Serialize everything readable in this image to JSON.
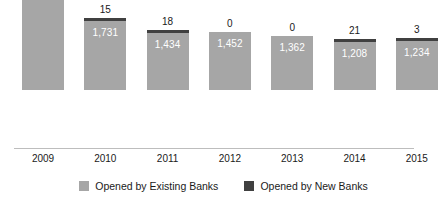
{
  "chart_data": {
    "type": "bar",
    "subtype": "stacked-bar",
    "title": "",
    "xlabel": "",
    "ylabel": "",
    "grid": false,
    "axis_visible": {
      "x": true,
      "y": false
    },
    "ylim": [
      0,
      3200
    ],
    "legend_position": "bottom-center",
    "categories": [
      "2009",
      "2010",
      "2011",
      "2012",
      "2013",
      "2014",
      "2015"
    ],
    "series": [
      {
        "name": "Opened by Existing Banks",
        "color": "#a6a6a6",
        "values": [
          2800,
          1731,
          1434,
          1452,
          1362,
          1208,
          1234
        ],
        "value_labels": [
          "2,800",
          "1,731",
          "1,434",
          "1,452",
          "1,362",
          "1,208",
          "1,234"
        ],
        "label_position": "inside-top"
      },
      {
        "name": "Opened by New Banks",
        "color": "#404040",
        "values": [
          81,
          15,
          18,
          0,
          0,
          21,
          3
        ],
        "value_labels": [
          "81",
          "15",
          "18",
          "0",
          "0",
          "21",
          "3"
        ],
        "label_position": "outside-top"
      }
    ]
  },
  "legend": {
    "items": [
      {
        "label": "Opened by Existing Banks",
        "color": "#a6a6a6"
      },
      {
        "label": "Opened by New Banks",
        "color": "#404040"
      }
    ]
  },
  "colors": {
    "existing": "#a6a6a6",
    "new": "#404040",
    "axis": "#bdbdbd",
    "text": "#1a1a1a",
    "inside_label_text": "#ffffff",
    "background": "#ffffff"
  }
}
